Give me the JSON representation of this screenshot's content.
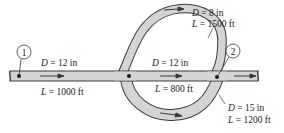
{
  "diagram": {
    "type": "pipe-network",
    "colors": {
      "pipe_fill": "#d4d4d4",
      "pipe_stroke": "#3a3a3a",
      "text": "#1a1a1a",
      "background": "#ffffff"
    },
    "nodes": [
      {
        "id": "1",
        "label": "1"
      },
      {
        "id": "2",
        "label": "2"
      }
    ],
    "pipes": [
      {
        "name": "inlet-pipe",
        "D_var": "D",
        "D_val": " = 12 in",
        "L_var": "L",
        "L_val": " = 1000 ft"
      },
      {
        "name": "upper-branch",
        "D_var": "D",
        "D_val": " = 8 in",
        "L_var": "L",
        "L_val": " = 1500 ft"
      },
      {
        "name": "middle-branch",
        "D_var": "D",
        "D_val": " = 12 in",
        "L_var": "L",
        "L_val": " = 800 ft"
      },
      {
        "name": "lower-branch",
        "D_var": "D",
        "D_val": " = 15 in",
        "L_var": "L",
        "L_val": " = 1200 ft"
      }
    ]
  }
}
